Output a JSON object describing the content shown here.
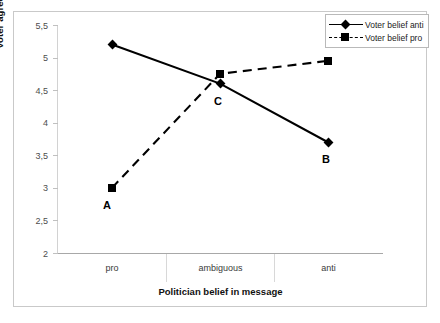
{
  "chart_data": {
    "type": "line",
    "title": "",
    "xlabel": "Politician belief in message",
    "ylabel": "Voter agreement with politician",
    "categories": [
      "pro",
      "ambiguous",
      "anti"
    ],
    "ylim": [
      2,
      5.5
    ],
    "ytick_labels": [
      "5,5",
      "5",
      "4,5",
      "4",
      "3,5",
      "3",
      "2,5",
      "2"
    ],
    "ytick_values": [
      5.5,
      5,
      4.5,
      4,
      3.5,
      3,
      2.5,
      2
    ],
    "grid": false,
    "legend_position": "top-right",
    "series": [
      {
        "name": "Voter belief anti",
        "marker": "diamond",
        "line_style": "solid",
        "color": "#000000",
        "values": [
          5.2,
          4.6,
          3.7
        ]
      },
      {
        "name": "Voter belief pro",
        "marker": "square",
        "line_style": "dashed",
        "color": "#000000",
        "values": [
          3.0,
          4.75,
          4.95
        ]
      }
    ],
    "annotations": [
      {
        "label": "A",
        "series": "Voter belief pro",
        "category": "pro",
        "value": 3.0
      },
      {
        "label": "B",
        "series": "Voter belief anti",
        "category": "anti",
        "value": 3.7
      },
      {
        "label": "C",
        "series": "Voter belief anti",
        "category": "ambiguous",
        "value": 4.6
      }
    ]
  },
  "legend": {
    "items": [
      {
        "label": "Voter belief anti"
      },
      {
        "label": "Voter belief pro"
      }
    ]
  }
}
